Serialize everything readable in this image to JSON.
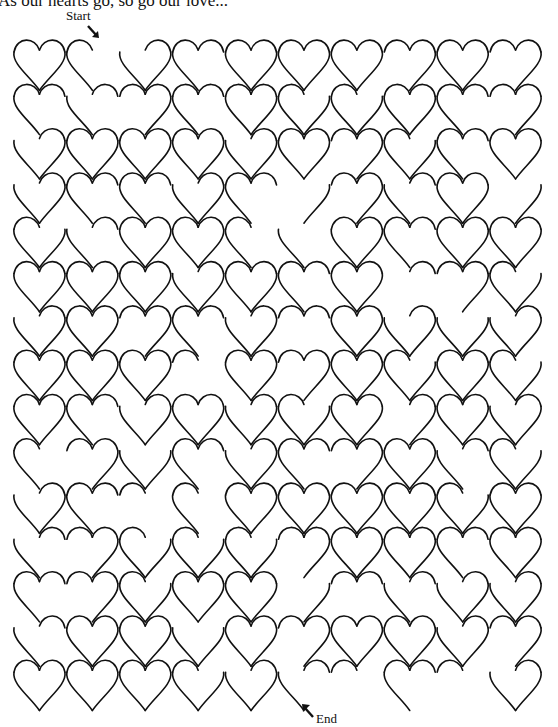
{
  "title": "As our hearts go, so go our love...",
  "labels": {
    "start": "Start",
    "end": "End"
  },
  "maze": {
    "type": "heart-maze",
    "columns": 10,
    "rows": 15,
    "origin_x": 13,
    "origin_y": 40,
    "cell_width": 52.9,
    "cell_height": 44.3,
    "stroke_color": "#111111",
    "start_gap": {
      "row": 0,
      "between_columns": [
        1,
        2
      ]
    },
    "end_gap": {
      "row": 14,
      "between_columns": [
        5,
        6
      ]
    }
  }
}
